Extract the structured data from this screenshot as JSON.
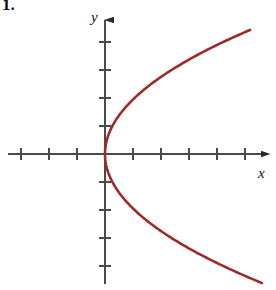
{
  "figure": {
    "problem_number": "1.",
    "background_color": "#ffffff"
  },
  "axes": {
    "x_label": "x",
    "y_label": "y",
    "axis_color": "#4a4a4a",
    "axis_stroke_width": 2,
    "tick_color": "#4a4a4a",
    "tick_stroke_width": 2,
    "tick_half_length": 6,
    "origin_px": {
      "x": 105,
      "y": 154
    },
    "unit_px": 28,
    "x_ticks_left_count": 3,
    "x_ticks_right_count": 5,
    "y_ticks_up_count": 4,
    "y_ticks_down_count": 4,
    "x_axis_start_px": 8,
    "x_axis_end_px": 268,
    "y_axis_top_px": 14,
    "y_axis_bottom_px": 284,
    "arrowheads": [
      "x-positive",
      "y-positive"
    ]
  },
  "chart_data": {
    "type": "line",
    "title": "",
    "xlabel": "x",
    "ylabel": "y",
    "grid": false,
    "legend": null,
    "xlim": [
      -3.75,
      5.9
    ],
    "ylim": [
      -4.9,
      5.0
    ],
    "x_tick_values": [
      -3,
      -2,
      -1,
      1,
      2,
      3,
      4,
      5
    ],
    "y_tick_values": [
      -4,
      -3,
      -2,
      -1,
      1,
      2,
      3,
      4
    ],
    "curve_color": "#9e2b2b",
    "curve_stroke_width": 2.6,
    "equation": "x = a*y^2",
    "vertex": [
      0,
      0
    ],
    "opens": "right",
    "series": [
      {
        "name": "parabola",
        "x": [
          0.0,
          0.12,
          0.29,
          0.52,
          0.8,
          1.14,
          1.53,
          1.98,
          2.48,
          3.04,
          3.65,
          4.32,
          5.04,
          5.18
        ],
        "y_upper": [
          0.0,
          0.5,
          0.78,
          1.04,
          1.3,
          1.55,
          1.8,
          2.05,
          2.29,
          2.54,
          2.78,
          3.03,
          3.27,
          4.43
        ],
        "y_lower": [
          0.0,
          -0.5,
          -0.78,
          -1.04,
          -1.3,
          -1.55,
          -1.8,
          -2.05,
          -2.29,
          -2.54,
          -2.78,
          -3.03,
          -3.27,
          -4.61
        ]
      }
    ],
    "endpoint_upper": [
      5.18,
      4.43
    ],
    "endpoint_lower": [
      5.11,
      -4.61
    ]
  }
}
